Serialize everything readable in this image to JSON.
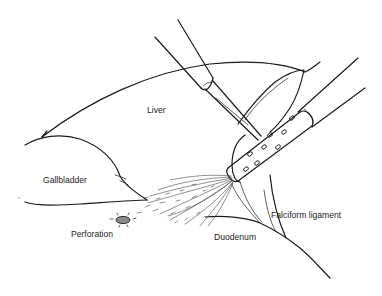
{
  "figure": {
    "type": "anatomical-surgical-illustration",
    "labels": {
      "liver": "Liver",
      "gallbladder": "Gallbladder",
      "perforation": "Perforation",
      "duodenum": "Duodenum",
      "falciform": "Falciform ligament"
    },
    "colors": {
      "line": "#1a1a1a",
      "background": "#ffffff",
      "perforation_fill": "#8a8a8a"
    }
  }
}
